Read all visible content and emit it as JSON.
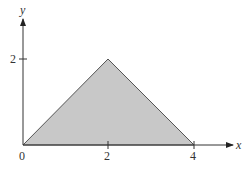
{
  "diagram": {
    "axes": {
      "x_label": "x",
      "y_label": "y",
      "x_ticks": [
        "0",
        "2",
        "4"
      ],
      "y_ticks": [
        "2"
      ]
    },
    "shape": {
      "type": "triangle",
      "vertices": [
        [
          0,
          0
        ],
        [
          2,
          2
        ],
        [
          4,
          0
        ]
      ],
      "fill": "#c8c8c8",
      "stroke": "#555555"
    }
  }
}
